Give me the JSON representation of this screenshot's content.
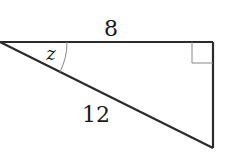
{
  "diagram": {
    "type": "right-triangle",
    "labels": {
      "top_side": "8",
      "hypotenuse": "12",
      "angle": "z"
    },
    "right_angle_marker": true,
    "colors": {
      "stroke": "#2b2b2b",
      "marker": "#888888",
      "background": "#ffffff"
    }
  }
}
